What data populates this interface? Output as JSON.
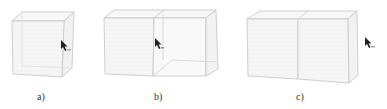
{
  "figure": {
    "panels": [
      {
        "id": "a",
        "label": "a)",
        "description": "single cube with cursor at right face"
      },
      {
        "id": "b",
        "label": "b)",
        "description": "cube being extended into a second cube, cursor at shared face"
      },
      {
        "id": "c",
        "label": "c)",
        "description": "two joined cubes forming a long box, cursor to the right"
      }
    ],
    "colors": {
      "edge": "#c8c8c8",
      "face": "#f4f4f4",
      "cursor": "#222222"
    }
  }
}
